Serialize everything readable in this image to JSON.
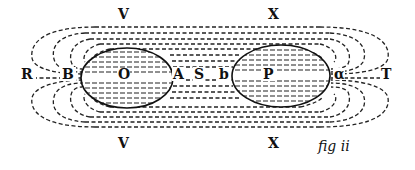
{
  "figure": {
    "caption": "fig ii",
    "labels": {
      "top_left": "V",
      "bottom_left": "V",
      "top_right": "X",
      "bottom_right": "X",
      "far_left": "R",
      "left_edge": "B",
      "left_center": "O",
      "left_inner": "A",
      "middle": "S",
      "right_inner": "b",
      "right_center": "P",
      "right_edge": "α",
      "far_right": "T"
    },
    "bodies": [
      {
        "name": "O",
        "cx": 127,
        "cy": 78,
        "rx": 46,
        "ry": 30
      },
      {
        "name": "P",
        "cx": 281,
        "cy": 76,
        "rx": 49,
        "ry": 31
      }
    ],
    "colors": {
      "ink": "#111111",
      "background": "#ffffff"
    }
  }
}
